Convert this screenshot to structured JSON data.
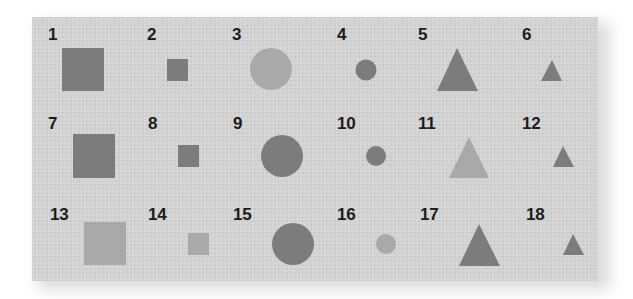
{
  "figure": {
    "colors": {
      "background": "#ffffff",
      "card": "#d3d3d3",
      "dark_shape": "#7c7c7c",
      "light_shape": "#a9a9a9",
      "label": "#1c1c1c"
    },
    "items": [
      {
        "label": "1",
        "shape": "square",
        "size": "large",
        "shade": "dark",
        "label_pos": [
          48,
          33
        ],
        "geom": {
          "x": 62,
          "y": 48,
          "w": 42,
          "h": 43
        }
      },
      {
        "label": "2",
        "shape": "square",
        "size": "small",
        "shade": "dark",
        "label_pos": [
          147,
          33
        ],
        "geom": {
          "x": 167,
          "y": 59,
          "w": 21,
          "h": 22
        }
      },
      {
        "label": "3",
        "shape": "circle",
        "size": "large",
        "shade": "light",
        "label_pos": [
          232,
          33
        ],
        "geom": {
          "cx": 271,
          "cy": 69,
          "r": 21
        }
      },
      {
        "label": "4",
        "shape": "circle",
        "size": "small",
        "shade": "dark",
        "label_pos": [
          337,
          33
        ],
        "geom": {
          "cx": 366,
          "cy": 70,
          "r": 10.5
        }
      },
      {
        "label": "5",
        "shape": "triangle",
        "size": "large",
        "shade": "dark",
        "label_pos": [
          418,
          33
        ],
        "geom": {
          "apex": [
            457,
            48
          ],
          "base_left": [
            437,
            91
          ],
          "base_right": [
            478,
            91
          ]
        }
      },
      {
        "label": "6",
        "shape": "triangle",
        "size": "small",
        "shade": "dark",
        "label_pos": [
          522,
          33
        ],
        "geom": {
          "apex": [
            552,
            60
          ],
          "base_left": [
            541,
            81
          ],
          "base_right": [
            562,
            81
          ]
        }
      },
      {
        "label": "7",
        "shape": "square",
        "size": "large",
        "shade": "dark",
        "label_pos": [
          48,
          122
        ],
        "geom": {
          "x": 73,
          "y": 134,
          "w": 42,
          "h": 44
        }
      },
      {
        "label": "8",
        "shape": "square",
        "size": "small",
        "shade": "dark",
        "label_pos": [
          148,
          122
        ],
        "geom": {
          "x": 178,
          "y": 145,
          "w": 21,
          "h": 22
        }
      },
      {
        "label": "9",
        "shape": "circle",
        "size": "large",
        "shade": "dark",
        "label_pos": [
          233,
          122
        ],
        "geom": {
          "cx": 282,
          "cy": 156,
          "r": 21
        }
      },
      {
        "label": "10",
        "shape": "circle",
        "size": "small",
        "shade": "dark",
        "label_pos": [
          337,
          122
        ],
        "geom": {
          "cx": 376,
          "cy": 156,
          "r": 10
        }
      },
      {
        "label": "11",
        "shape": "triangle",
        "size": "large",
        "shade": "light",
        "label_pos": [
          418,
          122
        ],
        "geom": {
          "apex": [
            469,
            137
          ],
          "base_left": [
            449,
            178
          ],
          "base_right": [
            489,
            178
          ]
        }
      },
      {
        "label": "12",
        "shape": "triangle",
        "size": "small",
        "shade": "dark",
        "label_pos": [
          522,
          122
        ],
        "geom": {
          "apex": [
            563,
            146
          ],
          "base_left": [
            553,
            167
          ],
          "base_right": [
            574,
            167
          ]
        }
      },
      {
        "label": "13",
        "shape": "square",
        "size": "large",
        "shade": "light",
        "label_pos": [
          50,
          213
        ],
        "geom": {
          "x": 84,
          "y": 222,
          "w": 42,
          "h": 43
        }
      },
      {
        "label": "14",
        "shape": "square",
        "size": "small",
        "shade": "light",
        "label_pos": [
          148,
          213
        ],
        "geom": {
          "x": 188,
          "y": 233,
          "w": 21,
          "h": 22
        }
      },
      {
        "label": "15",
        "shape": "circle",
        "size": "large",
        "shade": "dark",
        "label_pos": [
          233,
          213
        ],
        "geom": {
          "cx": 293,
          "cy": 244,
          "r": 21
        }
      },
      {
        "label": "16",
        "shape": "circle",
        "size": "small",
        "shade": "light",
        "label_pos": [
          337,
          213
        ],
        "geom": {
          "cx": 386,
          "cy": 244,
          "r": 10
        }
      },
      {
        "label": "17",
        "shape": "triangle",
        "size": "large",
        "shade": "dark",
        "label_pos": [
          420,
          213
        ],
        "geom": {
          "apex": [
            479,
            224
          ],
          "base_left": [
            459,
            266
          ],
          "base_right": [
            500,
            266
          ]
        }
      },
      {
        "label": "18",
        "shape": "triangle",
        "size": "small",
        "shade": "dark",
        "label_pos": [
          526,
          213
        ],
        "geom": {
          "apex": [
            573,
            234
          ],
          "base_left": [
            563,
            255
          ],
          "base_right": [
            584,
            255
          ]
        }
      }
    ]
  }
}
